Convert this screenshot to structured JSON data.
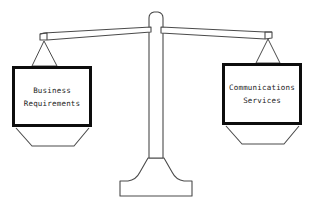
{
  "diagram": {
    "type": "balance-scale",
    "background_color": "#ffffff",
    "line_color": "#4a4a4a",
    "box_border_color": "#0d0d0d",
    "text_color": "#1a1a1a",
    "caption": {
      "text": "",
      "visible": false,
      "note": "faint cropped artifacts at top edge"
    },
    "beam": {
      "tilt": "left side lower than right side",
      "left_tip_y": 38,
      "right_tip_y": 33,
      "pivot_x": 156
    },
    "pans": [
      {
        "id": "left",
        "side": "left",
        "lines": [
          "Business",
          "Requirements"
        ],
        "box": {
          "x": 12,
          "y": 66,
          "width": 80,
          "height": 61
        }
      },
      {
        "id": "right",
        "side": "right",
        "lines": [
          "Communications",
          "Services"
        ],
        "box": {
          "x": 222,
          "y": 63,
          "width": 80,
          "height": 62
        }
      }
    ],
    "column": {
      "name": "center-post",
      "top_y": 12,
      "base_y": 196
    }
  }
}
